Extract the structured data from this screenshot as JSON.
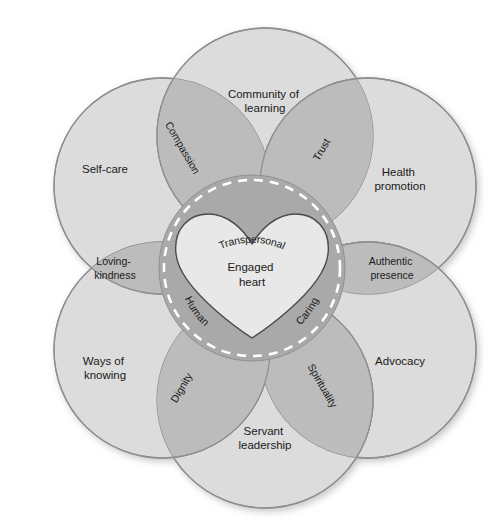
{
  "diagram": {
    "center": {
      "core_label_line1": "Engaged",
      "core_label_line2": "heart",
      "ring_labels": [
        {
          "text": "Transpersonal",
          "position": "top"
        },
        {
          "text": "Human",
          "position": "bottom-left"
        },
        {
          "text": "Caring",
          "position": "bottom-right"
        }
      ]
    },
    "petals": [
      {
        "id": "community-of-learning",
        "line1": "Community of",
        "line2": "learning",
        "position": "top"
      },
      {
        "id": "health-promotion",
        "line1": "Health",
        "line2": "promotion",
        "position": "top-right"
      },
      {
        "id": "advocacy",
        "line1": "Advocacy",
        "line2": "",
        "position": "bottom-right"
      },
      {
        "id": "servant-leadership",
        "line1": "Servant",
        "line2": "leadership",
        "position": "bottom"
      },
      {
        "id": "ways-of-knowing",
        "line1": "Ways of",
        "line2": "knowing",
        "position": "bottom-left"
      },
      {
        "id": "self-care",
        "line1": "Self-care",
        "line2": "",
        "position": "top-left"
      }
    ],
    "lenses": [
      {
        "id": "compassion",
        "line1": "Compassion",
        "line2": "",
        "between": "self-care / community-of-learning"
      },
      {
        "id": "trust",
        "line1": "Trust",
        "line2": "",
        "between": "community-of-learning / health-promotion"
      },
      {
        "id": "authentic-presence",
        "line1": "Authentic",
        "line2": "presence",
        "between": "health-promotion / advocacy"
      },
      {
        "id": "spirituality",
        "line1": "Spirituality",
        "line2": "",
        "between": "advocacy / servant-leadership"
      },
      {
        "id": "dignity",
        "line1": "Dignity",
        "line2": "",
        "between": "servant-leadership / ways-of-knowing"
      },
      {
        "id": "loving-kindness",
        "line1": "Loving-",
        "line2": "kindness",
        "between": "ways-of-knowing / self-care"
      }
    ],
    "colors": {
      "background": "#ffffff",
      "petal_fill": "#dcdcdc",
      "petal_stroke": "#8f8f8f",
      "lens_fill": "#bcbcbc",
      "core_fill": "#a9a9a9",
      "core_dash": "#ffffff",
      "heart_fill": "#e6e6e6",
      "heart_stroke": "#4a4a4a",
      "text": "#1a1a1a"
    }
  }
}
